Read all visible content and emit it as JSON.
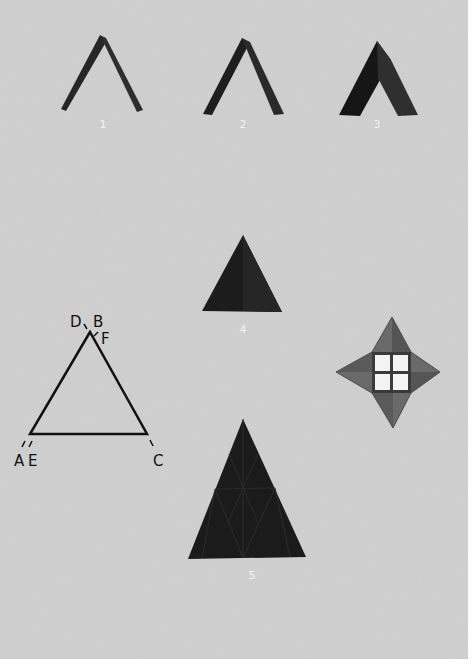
{
  "plate": {
    "background": "#cfcfcf",
    "figures": [
      {
        "number": "1",
        "description": "narrow inverted-V paper fold"
      },
      {
        "number": "2",
        "description": "wider inverted-V paper fold"
      },
      {
        "number": "3",
        "description": "broad inverted-V paper fold, shaded"
      },
      {
        "number": "4",
        "description": "small folded triangle"
      },
      {
        "number": "5",
        "description": "large folded triangle with diamond pattern"
      }
    ],
    "diagram": {
      "labels": {
        "D": "D",
        "B": "B",
        "F": "F",
        "A": "A",
        "E": "E",
        "C": "C"
      }
    },
    "star": {
      "description": "four-pointed folded star with four-pane window center"
    }
  }
}
